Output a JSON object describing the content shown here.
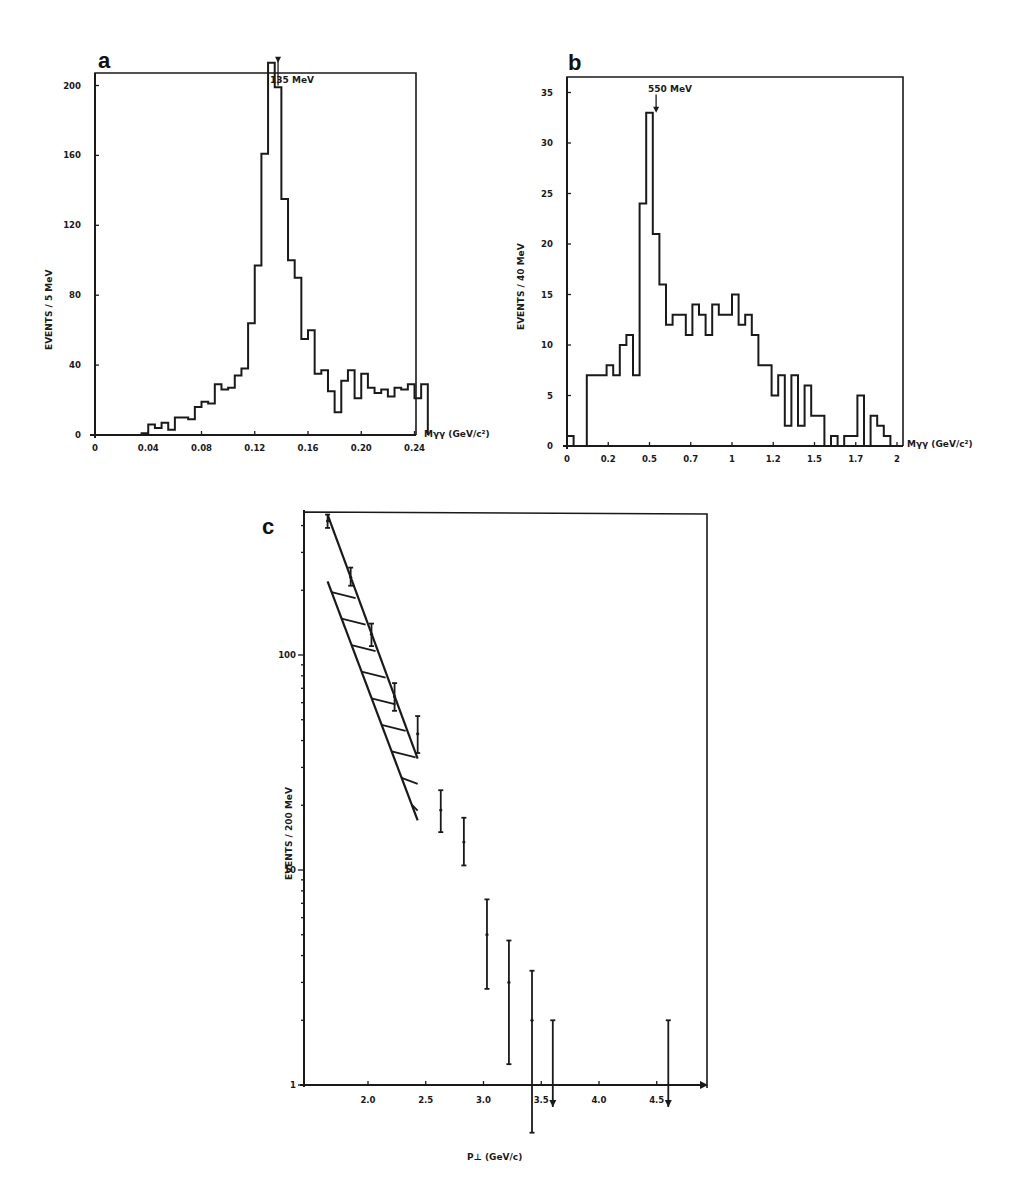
{
  "chart_data": [
    {
      "panel": "a",
      "type": "bar",
      "style": "step-histogram",
      "title": "",
      "annotation": "135 MeV",
      "annotation_x": 0.1375,
      "xlabel": "Mγγ (GeV/c²)",
      "ylabel": "EVENTS / 5 MeV",
      "xlim": [
        0,
        0.245
      ],
      "ylim": [
        0,
        230
      ],
      "xticks": [
        0,
        0.04,
        0.08,
        0.12,
        0.16,
        0.2,
        0.24
      ],
      "xtick_labels": [
        "0",
        "0.04",
        "0.08",
        "0.12",
        "0.16",
        "0.20",
        "0.24"
      ],
      "yticks": [
        0,
        40,
        80,
        120,
        160,
        200
      ],
      "ytick_labels": [
        "0",
        "40",
        "80",
        "120",
        "160",
        "200"
      ],
      "bin_width": 0.005,
      "bin_start": 0.0,
      "values": [
        0,
        0,
        0,
        0,
        0,
        0,
        0,
        1,
        6,
        4,
        7,
        3,
        10,
        10,
        9,
        16,
        19,
        18,
        29,
        26,
        27,
        34,
        38,
        64,
        97,
        161,
        213,
        199,
        135,
        100,
        90,
        55,
        60,
        35,
        37,
        25,
        13,
        31,
        37,
        21,
        35,
        27,
        24,
        26,
        22,
        27,
        26,
        29,
        21,
        29
      ],
      "grid": false
    },
    {
      "panel": "b",
      "type": "bar",
      "style": "step-histogram",
      "title": "",
      "annotation": "550 MeV",
      "annotation_x": 0.54,
      "xlabel": "Mγγ (GeV/c²)",
      "ylabel": "EVENTS / 40 MeV",
      "xlim": [
        0,
        2
      ],
      "ylim": [
        0,
        37
      ],
      "xticks": [
        0,
        0.25,
        0.5,
        0.75,
        1.0,
        1.25,
        1.5,
        1.75,
        2.0
      ],
      "xtick_labels": [
        "0",
        "0.2",
        "0.5",
        "0.7",
        "1",
        "1.2",
        "1.5",
        "1.7",
        "2"
      ],
      "yticks": [
        0,
        5,
        10,
        15,
        20,
        25,
        30,
        35
      ],
      "ytick_labels": [
        "0",
        "5",
        "10",
        "15",
        "20",
        "25",
        "30",
        "35"
      ],
      "bin_width": 0.04,
      "bin_start": 0.0,
      "values": [
        1,
        0,
        0,
        7,
        7,
        7,
        8,
        7,
        10,
        11,
        7,
        24,
        33,
        21,
        16,
        12,
        13,
        13,
        11,
        14,
        13,
        11,
        14,
        13,
        13,
        15,
        12,
        13,
        11,
        8,
        8,
        5,
        7,
        2,
        7,
        2,
        6,
        3,
        3,
        0,
        1,
        0,
        1,
        1,
        5,
        0,
        3,
        2,
        1,
        0
      ],
      "grid": false
    },
    {
      "panel": "c",
      "type": "scatter",
      "style": "error-bars-log-y",
      "title": "",
      "xlabel": "P⊥ (GeV/c)",
      "ylabel": "EVENTS / 200 MeV",
      "xlim": [
        1.44,
        4.88
      ],
      "ylim": [
        1,
        450
      ],
      "yscale": "log",
      "xticks": [
        2.0,
        2.5,
        3.0,
        3.5,
        4.0,
        4.5
      ],
      "xtick_labels": [
        "2.0",
        "2.5",
        "3.0",
        "3.5",
        "4.0",
        "4.5"
      ],
      "yticks": [
        1,
        10,
        100
      ],
      "ytick_labels": [
        "1",
        "10",
        "100"
      ],
      "points": [
        {
          "x": 1.65,
          "y": 420,
          "lo": 390,
          "hi": 450
        },
        {
          "x": 1.85,
          "y": 230,
          "lo": 210,
          "hi": 255
        },
        {
          "x": 2.03,
          "y": 125,
          "lo": 110,
          "hi": 140
        },
        {
          "x": 2.23,
          "y": 64,
          "lo": 55,
          "hi": 74
        },
        {
          "x": 2.43,
          "y": 43,
          "lo": 35,
          "hi": 52
        },
        {
          "x": 2.63,
          "y": 19,
          "lo": 15,
          "hi": 23.5
        },
        {
          "x": 2.83,
          "y": 13.5,
          "lo": 10.5,
          "hi": 17.5
        },
        {
          "x": 3.03,
          "y": 5,
          "lo": 2.8,
          "hi": 7.3
        },
        {
          "x": 3.22,
          "y": 3,
          "lo": 1.25,
          "hi": 4.7
        },
        {
          "x": 3.42,
          "y": 2,
          "lo": 0.6,
          "hi": 3.4
        }
      ],
      "upper_limits": [
        {
          "x": 3.6,
          "y": 2.0
        },
        {
          "x": 4.6,
          "y": 2.0
        }
      ],
      "band": {
        "label": "hatched prediction band",
        "x": [
          1.65,
          2.43
        ],
        "upper": [
          450,
          33
        ],
        "lower": [
          220,
          17
        ]
      },
      "grid": false
    }
  ]
}
